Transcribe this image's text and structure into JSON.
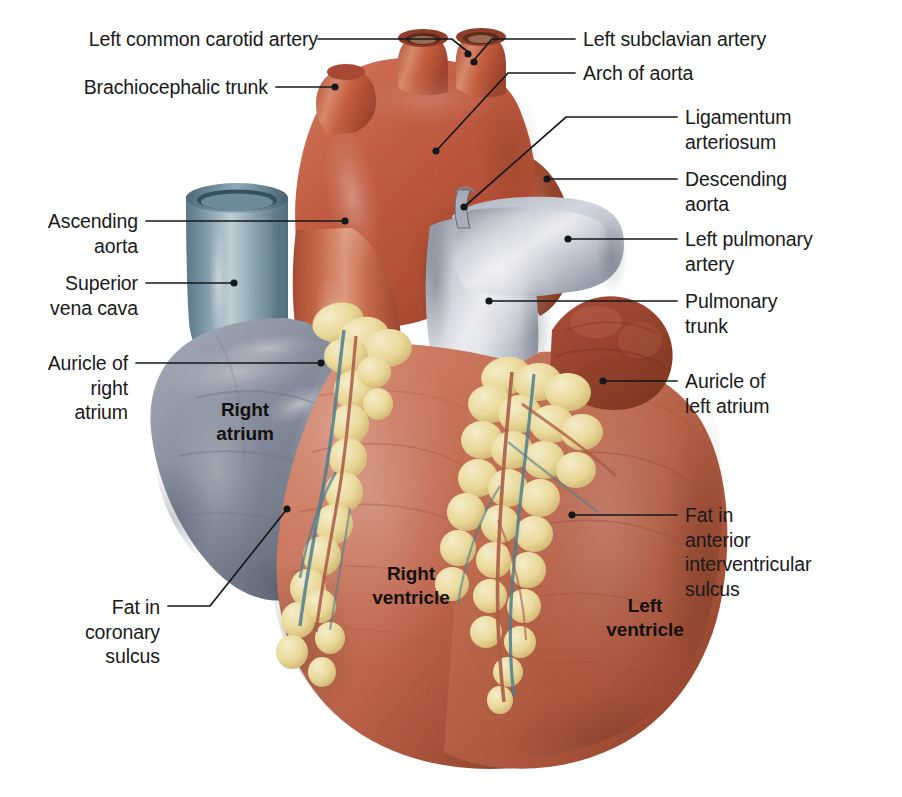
{
  "figure": {
    "kind": "anatomical-illustration",
    "background_color": "#ffffff",
    "leader_color": "#13181d"
  },
  "palette": {
    "aorta_red": "#c15b42",
    "aorta_red_dark": "#9c4430",
    "myocardium_red": "#c4604a",
    "myocardium_dark": "#8e3f2d",
    "myocardium_light": "#dc8a74",
    "atrium_blue_grey": "#8a909e",
    "atrium_blue_grey_dark": "#5f6575",
    "atrium_blue_grey_light": "#b9bfca",
    "vena_cava_blue": "#7d94a4",
    "vena_cava_blue_dark": "#4e6675",
    "pulmonary_grey": "#b3b8c4",
    "pulmonary_grey_light": "#e4e6ec",
    "fat_yellow": "#ecd694",
    "fat_yellow_light": "#f7eec6",
    "fat_yellow_dark": "#cdae6a",
    "coronary_artery": "#b05a46",
    "coronary_vein": "#6f93a4",
    "text_color": "#1a1a1a"
  },
  "labels": {
    "left": [
      {
        "id": "left-common-carotid-artery",
        "text": "Left common carotid artery"
      },
      {
        "id": "brachiocephalic-trunk",
        "text": "Brachiocephalic trunk"
      },
      {
        "id": "ascending-aorta",
        "text": "Ascending\naorta"
      },
      {
        "id": "superior-vena-cava",
        "text": "Superior\nvena cava"
      },
      {
        "id": "auricle-of-right-atrium",
        "text": "Auricle of\nright\natrium"
      },
      {
        "id": "fat-in-coronary-sulcus",
        "text": "Fat in\ncoronary\nsulcus"
      }
    ],
    "right": [
      {
        "id": "left-subclavian-artery",
        "text": "Left subclavian artery"
      },
      {
        "id": "arch-of-aorta",
        "text": "Arch of aorta"
      },
      {
        "id": "ligamentum-arteriosum",
        "text": "Ligamentum\narteriosum"
      },
      {
        "id": "descending-aorta",
        "text": "Descending\naorta"
      },
      {
        "id": "left-pulmonary-artery",
        "text": "Left pulmonary\nartery"
      },
      {
        "id": "pulmonary-trunk",
        "text": "Pulmonary\ntrunk"
      },
      {
        "id": "auricle-of-left-atrium",
        "text": "Auricle of\nleft atrium"
      },
      {
        "id": "fat-in-anterior-interventricular-sulcus",
        "text": "Fat in\nanterior\ninterventricular\nsulcus"
      }
    ],
    "inner": [
      {
        "id": "right-atrium",
        "text": "Right\natrium"
      },
      {
        "id": "right-ventricle",
        "text": "Right\nventricle"
      },
      {
        "id": "left-ventricle",
        "text": "Left\nventricle"
      }
    ]
  },
  "label_layout": {
    "left_common_carotid_artery": {
      "x": 310,
      "y": 28,
      "align": "right",
      "leader": [
        [
          318,
          39
        ],
        [
          430,
          39
        ],
        [
          430,
          39
        ]
      ],
      "dot": [
        430,
        39
      ]
    },
    "brachiocephalic_trunk": {
      "x": 268,
      "y": 76,
      "align": "right",
      "leader": [
        [
          276,
          87
        ],
        [
          337,
          87
        ]
      ],
      "dot": [
        337,
        87
      ]
    },
    "ascending_aorta": {
      "x": 138,
      "y": 210,
      "align": "right",
      "leader": [
        [
          146,
          221
        ],
        [
          347,
          221
        ]
      ],
      "dot": [
        347,
        221
      ]
    },
    "superior_vena_cava": {
      "x": 138,
      "y": 272,
      "align": "right",
      "leader": [
        [
          146,
          283
        ],
        [
          236,
          283
        ]
      ],
      "dot": [
        236,
        283
      ]
    },
    "auricle_of_right_atrium": {
      "x": 128,
      "y": 352,
      "align": "right",
      "leader": [
        [
          136,
          363
        ],
        [
          323,
          363
        ]
      ],
      "dot": [
        323,
        363
      ]
    },
    "fat_in_coronary_sulcus": {
      "x": 160,
      "y": 596,
      "align": "right",
      "leader": [
        [
          168,
          606
        ],
        [
          208,
          606
        ],
        [
          288,
          508
        ]
      ],
      "dot": [
        288,
        508
      ]
    },
    "left_subclavian_artery": {
      "x": 583,
      "y": 28,
      "align": "left",
      "leader": [
        [
          575,
          39
        ],
        [
          471,
          39
        ]
      ],
      "dot": [
        471,
        61
      ]
    },
    "arch_of_aorta": {
      "x": 583,
      "y": 62,
      "align": "left",
      "leader": [
        [
          575,
          73
        ],
        [
          504,
          73
        ],
        [
          434,
          152
        ]
      ],
      "dot": [
        434,
        152
      ]
    },
    "ligamentum_arteriosum": {
      "x": 685,
      "y": 106,
      "align": "left",
      "leader": [
        [
          677,
          117
        ],
        [
          560,
          117
        ],
        [
          462,
          208
        ]
      ],
      "dot": [
        462,
        208
      ]
    },
    "descending_aorta": {
      "x": 685,
      "y": 168,
      "align": "left",
      "leader": [
        [
          677,
          179
        ],
        [
          545,
          179
        ]
      ],
      "dot": [
        545,
        179
      ]
    },
    "left_pulmonary_artery": {
      "x": 685,
      "y": 228,
      "align": "left",
      "leader": [
        [
          677,
          239
        ],
        [
          566,
          239
        ]
      ],
      "dot": [
        566,
        239
      ]
    },
    "pulmonary_trunk": {
      "x": 685,
      "y": 290,
      "align": "left",
      "leader": [
        [
          677,
          301
        ],
        [
          487,
          301
        ]
      ],
      "dot": [
        487,
        301
      ]
    },
    "auricle_of_left_atrium": {
      "x": 685,
      "y": 370,
      "align": "left",
      "leader": [
        [
          677,
          381
        ],
        [
          601,
          381
        ]
      ],
      "dot": [
        601,
        381
      ]
    },
    "fat_in_anterior_interventricular_sulcus": {
      "x": 685,
      "y": 504,
      "align": "left",
      "leader": [
        [
          677,
          515
        ],
        [
          570,
          515
        ]
      ],
      "dot": [
        570,
        515
      ]
    },
    "right_atrium": {
      "x": 245,
      "y": 400
    },
    "right_ventricle": {
      "x": 411,
      "y": 565
    },
    "left_ventricle": {
      "x": 645,
      "y": 597
    }
  }
}
